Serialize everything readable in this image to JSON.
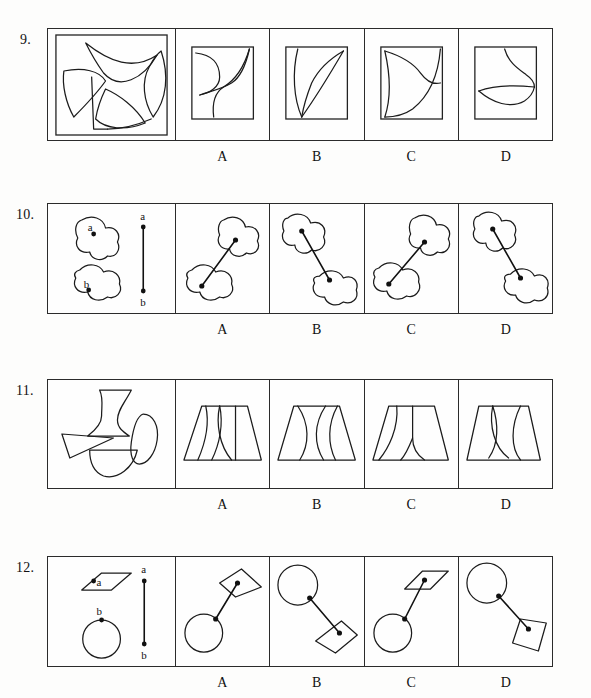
{
  "page": {
    "background_color": "#fdfdfc",
    "ink_color": "#1b1b1b"
  },
  "option_labels": [
    "A",
    "B",
    "C",
    "D"
  ],
  "questions": [
    {
      "number": "9.",
      "prompt_description": "Four curved fin-like shapes arranged in a pinwheel inside a square",
      "options": [
        {
          "label": "A",
          "description": "Square with two curved fin shapes forming an S-figure"
        },
        {
          "label": "B",
          "description": "Square with a tall leaf shape touching top-right corner"
        },
        {
          "label": "C",
          "description": "Square with a wide fin curve sweeping from top-left to bottom-right"
        },
        {
          "label": "D",
          "description": "Square with a leaf and an S curve across the middle"
        }
      ]
    },
    {
      "number": "10.",
      "prompt_description": "Two cloud-like blobs labelled a and b, with a vertical reference segment from a to b",
      "prompt_labels": [
        "a",
        "b",
        "a",
        "b"
      ],
      "options": [
        {
          "label": "A",
          "description": "Blob a lower-left joined by line up to blob b upper-right"
        },
        {
          "label": "B",
          "description": "Blob a upper-left joined by line down to blob b lower-right"
        },
        {
          "label": "C",
          "description": "Blob a lower-left joined by line up to blob b upper-right, rotated"
        },
        {
          "label": "D",
          "description": "Blob a upper-left joined by line down to blob b lower-right, rotated"
        }
      ]
    },
    {
      "number": "11.",
      "prompt_description": "Four pieces: hourglass vase, teardrop leaf, bowtie triangle, half disc",
      "options": [
        {
          "label": "A",
          "description": "Trapezoid assembled from pieces with two inner curves"
        },
        {
          "label": "B",
          "description": "Symmetric trapezoid with two opposed inner curves"
        },
        {
          "label": "C",
          "description": "Trapezoid with long sweeping inner curve and small curve"
        },
        {
          "label": "D",
          "description": "Trapezoid with two bulging inner curves"
        }
      ]
    },
    {
      "number": "12.",
      "prompt_description": "Parallelogram labelled a and circle labelled b, with a vertical reference segment from a to b",
      "prompt_labels": [
        "a",
        "b",
        "a",
        "b"
      ],
      "options": [
        {
          "label": "A",
          "description": "Circle lower-left linked to parallelogram upper-right"
        },
        {
          "label": "B",
          "description": "Circle upper-left linked to parallelogram lower-right"
        },
        {
          "label": "C",
          "description": "Circle lower-left linked to flat parallelogram upper-right"
        },
        {
          "label": "D",
          "description": "Circle upper-left linked to tilted parallelogram lower-right"
        }
      ]
    }
  ]
}
